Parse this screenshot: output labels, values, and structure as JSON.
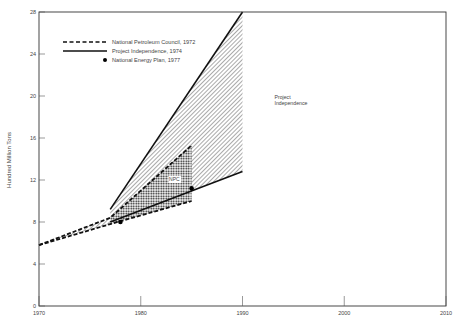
{
  "chart_data": {
    "type": "line",
    "title": "",
    "xlabel": "",
    "ylabel": "Hundred Million Tons",
    "xlim": [
      1970,
      2010
    ],
    "ylim": [
      0,
      28
    ],
    "x_ticks": [
      1970,
      1980,
      1990,
      2000,
      2010
    ],
    "y_ticks": [
      0,
      4,
      8,
      12,
      16,
      20,
      24,
      28
    ],
    "legend": {
      "placement": "top-left",
      "entries": [
        {
          "label": "National Petroleum Council, 1972",
          "style": "dashed"
        },
        {
          "label": "Project Independence, 1974",
          "style": "solid"
        },
        {
          "label": "National Energy Plan, 1977",
          "style": "dot"
        }
      ]
    },
    "series": [
      {
        "name": "National Petroleum Council, 1972 (upper)",
        "style": "dashed",
        "points": [
          [
            1970,
            5.8
          ],
          [
            1977,
            8.4
          ],
          [
            1985,
            15.3
          ]
        ]
      },
      {
        "name": "National Petroleum Council, 1972 (lower)",
        "style": "dashed",
        "points": [
          [
            1970,
            5.8
          ],
          [
            1977,
            7.8
          ],
          [
            1985,
            10.0
          ]
        ]
      },
      {
        "name": "Project Independence, 1974 (upper)",
        "style": "solid",
        "points": [
          [
            1977,
            9.2
          ],
          [
            1990,
            28.0
          ]
        ]
      },
      {
        "name": "Project Independence, 1974 (lower)",
        "style": "solid",
        "points": [
          [
            1977,
            8.0
          ],
          [
            1990,
            12.8
          ]
        ]
      },
      {
        "name": "National Energy Plan, 1977",
        "style": "dot",
        "points": [
          [
            1978,
            8.0
          ],
          [
            1985,
            11.2
          ]
        ]
      }
    ],
    "regions": [
      {
        "label": "Project Independence",
        "fill": "hatched"
      },
      {
        "label": "NPC",
        "fill": "dotted"
      }
    ]
  }
}
